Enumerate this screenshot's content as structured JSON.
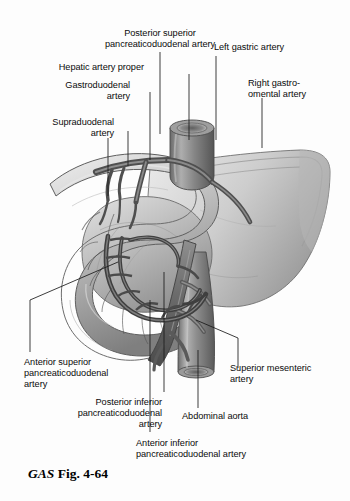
{
  "figure": {
    "caption_prefix": "GAS",
    "caption_rest": "Fig. 4-64",
    "background_color": "#fdfdfd",
    "ink_color": "#0b0b0b",
    "leader_color": "#1a1a1a",
    "style": "grayscale anatomical illustration"
  },
  "labels": [
    {
      "id": "posterior-superior-pancreaticoduodenal-artery",
      "text": "Posterior superior\npancreaticoduodenal artery",
      "align": "center",
      "x": 70,
      "y": 28,
      "w": 180
    },
    {
      "id": "left-gastric-artery",
      "text": "Left gastric artery",
      "align": "left",
      "x": 214,
      "y": 42,
      "w": 120
    },
    {
      "id": "hepatic-artery-proper",
      "text": "Hepatic artery proper",
      "align": "right",
      "x": 8,
      "y": 62,
      "w": 136
    },
    {
      "id": "gastroduodenal-artery",
      "text": "Gastroduodenal\nartery",
      "align": "right",
      "x": 8,
      "y": 80,
      "w": 122
    },
    {
      "id": "right-gastro-omental-artery",
      "text": "Right gastro-\nomental artery",
      "align": "left",
      "x": 248,
      "y": 78,
      "w": 100
    },
    {
      "id": "supraduodenal-artery",
      "text": "Supraduodenal\nartery",
      "align": "right",
      "x": 8,
      "y": 117,
      "w": 106
    },
    {
      "id": "anterior-superior-pancreaticoduodenal-artery",
      "text": "Anterior superior\npancreaticoduodenal\nartery",
      "align": "left",
      "x": 24,
      "y": 357,
      "w": 120
    },
    {
      "id": "superior-mesenteric-artery",
      "text": "Superior mesenteric\nartery",
      "align": "left",
      "x": 230,
      "y": 363,
      "w": 118
    },
    {
      "id": "posterior-inferior-pancreaticoduodenal-artery",
      "text": "Posterior inferior\npancreaticoduodenal\nartery",
      "align": "right",
      "x": 42,
      "y": 397,
      "w": 120
    },
    {
      "id": "abdominal-aorta",
      "text": "Abdominal aorta",
      "align": "left",
      "x": 182,
      "y": 411,
      "w": 112
    },
    {
      "id": "anterior-inferior-pancreaticoduodenal-artery",
      "text": "Anterior inferior\npancreaticoduodenal artery",
      "align": "left",
      "x": 136,
      "y": 438,
      "w": 160
    }
  ],
  "structures": [
    {
      "id": "duodenum",
      "name": "duodenum"
    },
    {
      "id": "pancreas-head",
      "name": "head of pancreas"
    },
    {
      "id": "pancreas-body-tail",
      "name": "body and tail of pancreas"
    },
    {
      "id": "abdominal-aorta-vessel",
      "name": "abdominal aorta"
    },
    {
      "id": "superior-mesenteric-artery-vessel",
      "name": "superior mesenteric artery"
    },
    {
      "id": "celiac-trunk",
      "name": "celiac trunk"
    },
    {
      "id": "pancreaticoduodenal-arcade",
      "name": "pancreaticoduodenal arterial arcade"
    }
  ]
}
